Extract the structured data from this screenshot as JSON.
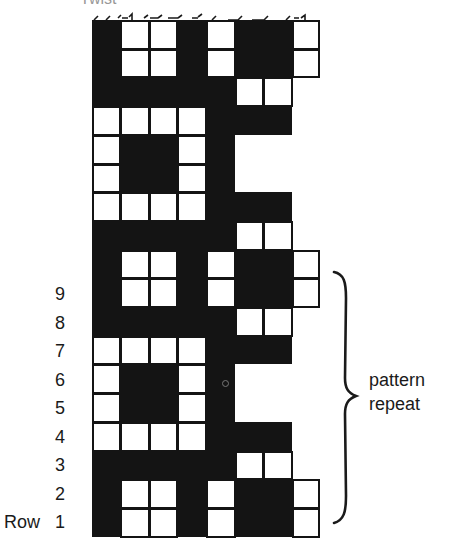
{
  "figure": {
    "cut_off_heading": "Twist",
    "grid": {
      "columns": 8,
      "rows_visible": 18,
      "legend": {
        "D": "dark / filled square",
        "W": "light / open square",
        "_": "empty (outside chart)"
      },
      "rows_top_to_bottom": [
        "DWWDWDDW",
        "DWWDWDDW",
        "DDDDDWW_",
        "WWWWDDD_",
        "WDDWD___",
        "WDDWD___",
        "WWWWDDD_",
        "DDDDDWW_",
        "DWWDWDDW",
        "DWWDWDDW",
        "DDDDDWW_",
        "WWWWDDD_",
        "WDDWD___",
        "WDDWD___",
        "WWWWDDD_",
        "DDDDDWW_",
        "DWWDWDDW",
        "DWWDWDDW"
      ],
      "colors": {
        "dark": "#141414",
        "light": "#ffffff"
      }
    },
    "row_labels": {
      "prefix": "Row",
      "numbers": [
        "9",
        "8",
        "7",
        "6",
        "5",
        "4",
        "3",
        "2",
        "1"
      ]
    },
    "annotation": {
      "line1": "pattern",
      "line2": "repeat",
      "spans_rows": "1-9"
    }
  }
}
